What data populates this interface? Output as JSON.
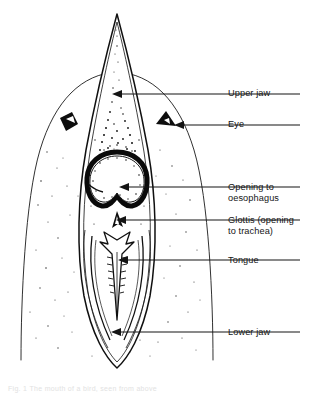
{
  "figure": {
    "background_color": "#ffffff",
    "ink_color": "#101010",
    "width": 313,
    "height": 396
  },
  "labels": [
    {
      "key": "upper_jaw",
      "text": "Upper jaw",
      "x": 228,
      "y": 88,
      "leader": {
        "x1": 300,
        "y1": 94,
        "x2": 113,
        "y2": 94
      }
    },
    {
      "key": "eye",
      "text": "Eye",
      "x": 228,
      "y": 119,
      "leader": {
        "x1": 300,
        "y1": 125,
        "x2": 158,
        "y2": 125
      }
    },
    {
      "key": "opening_to_oesophagus",
      "text": "Opening to\noesophagus",
      "x": 228,
      "y": 182,
      "leader": {
        "x1": 300,
        "y1": 187,
        "x2": 121,
        "y2": 187
      }
    },
    {
      "key": "glottis",
      "text": "Glottis (opening\nto trachea)",
      "x": 228,
      "y": 215,
      "leader": {
        "x1": 300,
        "y1": 220,
        "x2": 118,
        "y2": 220
      }
    },
    {
      "key": "tongue",
      "text": "Tongue",
      "x": 228,
      "y": 255,
      "leader": {
        "x1": 300,
        "y1": 260,
        "x2": 120,
        "y2": 260
      }
    },
    {
      "key": "lower_jaw",
      "text": "Lower jaw",
      "x": 228,
      "y": 327,
      "leader": {
        "x1": 300,
        "y1": 332,
        "x2": 113,
        "y2": 332
      }
    }
  ],
  "caption": {
    "text": "Fig. 1 The mouth of a bird, seen from above"
  },
  "anatomy": {
    "parts": [
      "head-outline",
      "upper-jaw",
      "lower-jaw",
      "eye-left",
      "eye-right",
      "oesophagus-opening",
      "glottis",
      "tongue",
      "palate-stipple"
    ]
  }
}
